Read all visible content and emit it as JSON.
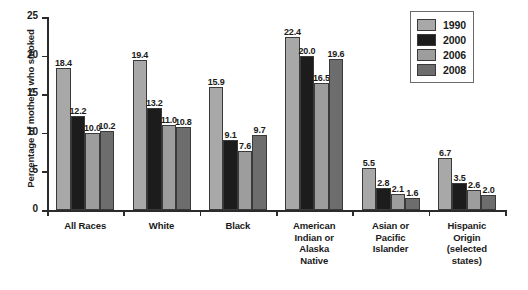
{
  "chart_data": {
    "type": "bar",
    "title": "",
    "xlabel": "",
    "ylabel": "Percentage of mothers who smoked",
    "ylim": [
      0,
      25
    ],
    "yticks": [
      "0",
      "5",
      "10",
      "15",
      "20",
      "25"
    ],
    "grid": false,
    "legend_position": "top-right",
    "categories": [
      "All Races",
      "White",
      "Black",
      "American Indian or Alaska Native",
      "Asian or Pacific Islander",
      "Hispanic Origin (selected states)"
    ],
    "category_lines": [
      [
        "All Races"
      ],
      [
        "White"
      ],
      [
        "Black"
      ],
      [
        "American",
        "Indian or",
        "Alaska",
        "Native"
      ],
      [
        "Asian or",
        "Pacific",
        "Islander"
      ],
      [
        "Hispanic",
        "Origin",
        "(selected",
        "states)"
      ]
    ],
    "series": [
      {
        "name": "1990",
        "color": "#a8a8a8",
        "values": [
          18.4,
          19.4,
          15.9,
          22.4,
          5.5,
          6.7
        ]
      },
      {
        "name": "2000",
        "color": "#1c1c1c",
        "values": [
          12.2,
          13.2,
          9.1,
          20.0,
          2.8,
          3.5
        ]
      },
      {
        "name": "2006",
        "color": "#9d9d9d",
        "values": [
          10.0,
          11.0,
          7.6,
          16.5,
          2.1,
          2.6
        ]
      },
      {
        "name": "2008",
        "color": "#6d6d6d",
        "values": [
          10.2,
          10.8,
          9.7,
          19.6,
          1.6,
          2.0
        ]
      }
    ],
    "value_labels": [
      [
        "18.4",
        "12.2",
        "10.0",
        "10.2"
      ],
      [
        "19.4",
        "13.2",
        "11.0",
        "10.8"
      ],
      [
        "15.9",
        "9.1",
        "7.6",
        "9.7"
      ],
      [
        "22.4",
        "20.0",
        "16.5",
        "19.6"
      ],
      [
        "5.5",
        "2.8",
        "2.1",
        "1.6"
      ],
      [
        "6.7",
        "3.5",
        "2.6",
        "2.0"
      ]
    ]
  },
  "legend": {
    "items": [
      {
        "label": "1990",
        "color": "#a8a8a8"
      },
      {
        "label": "2000",
        "color": "#1c1c1c"
      },
      {
        "label": "2006",
        "color": "#9d9d9d"
      },
      {
        "label": "2008",
        "color": "#6d6d6d"
      }
    ]
  }
}
